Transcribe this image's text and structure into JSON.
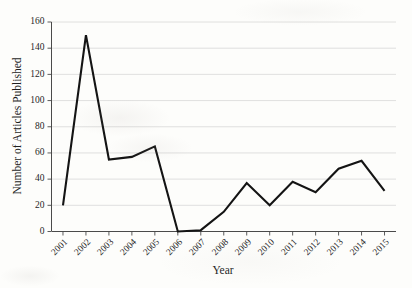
{
  "chart_data": {
    "type": "line",
    "title": "",
    "xlabel": "Year",
    "ylabel": "Number of Articles Published",
    "categories": [
      "2001",
      "2002",
      "2003",
      "2004",
      "2005",
      "2006",
      "2007",
      "2008",
      "2009",
      "2010",
      "2011",
      "2012",
      "2013",
      "2014",
      "2015"
    ],
    "values": [
      20,
      150,
      55,
      57,
      65,
      0,
      1,
      15,
      37,
      20,
      38,
      30,
      48,
      54,
      31
    ],
    "series": [
      {
        "name": "Number of Articles Published",
        "values": [
          20,
          150,
          55,
          57,
          65,
          0,
          1,
          15,
          37,
          20,
          38,
          30,
          48,
          54,
          31
        ]
      }
    ],
    "ylim": [
      0,
      160
    ],
    "yticks": [
      0,
      20,
      40,
      60,
      80,
      100,
      120,
      140,
      160
    ],
    "ytick_labels": [
      "0",
      "20",
      "40",
      "60",
      "80",
      "100",
      "120",
      "140",
      "160"
    ],
    "xtick_labels": [
      "2001",
      "2002",
      "2003",
      "2004",
      "2005",
      "2006",
      "2007",
      "2008",
      "2009",
      "2010",
      "2011",
      "2012",
      "2013",
      "2014",
      "2015"
    ],
    "grid": "horizontal",
    "legend": "none",
    "line_color": "#141414",
    "gridline_color": "#d8d8d8",
    "axis_color": "#4a4a4a",
    "background_color": "#fdfdfb",
    "markers": "none",
    "xtick_label_rotation": -45
  }
}
